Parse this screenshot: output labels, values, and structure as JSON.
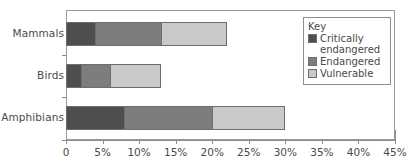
{
  "chart_data": {
    "type": "bar",
    "orientation": "horizontal",
    "stacked": true,
    "title": "",
    "xlabel": "",
    "ylabel": "",
    "categories": [
      "Mammals",
      "Birds",
      "Amphibians"
    ],
    "series": [
      {
        "name": "Critically endangered",
        "values": [
          4,
          2,
          8
        ],
        "color": "#4f4f4f"
      },
      {
        "name": "Endangered",
        "values": [
          9,
          4,
          12
        ],
        "color": "#7d7d7d"
      },
      {
        "name": "Vulnerable",
        "values": [
          9,
          7,
          10
        ],
        "color": "#c9c9c9"
      }
    ],
    "totals": [
      22,
      13,
      30
    ],
    "xlim": [
      0,
      45
    ],
    "xticks": [
      0,
      5,
      10,
      15,
      20,
      25,
      30,
      35,
      40,
      45
    ],
    "xtick_labels": [
      "0",
      "5%",
      "10%",
      "15%",
      "20%",
      "25%",
      "30%",
      "35%",
      "40%",
      "45%"
    ],
    "grid": false,
    "legend_position": "upper-right",
    "legend_title": "Key"
  },
  "legend": {
    "title": "Key",
    "entries": [
      {
        "label": "Critically endangered",
        "color": "#4f4f4f"
      },
      {
        "label": "Endangered",
        "color": "#7d7d7d"
      },
      {
        "label": "Vulnerable",
        "color": "#c9c9c9"
      }
    ]
  },
  "axis": {
    "x_tick_labels": [
      "0",
      "5%",
      "10%",
      "15%",
      "20%",
      "25%",
      "30%",
      "35%",
      "40%",
      "45%"
    ],
    "y_category_labels": [
      "Mammals",
      "Birds",
      "Amphibians"
    ]
  }
}
